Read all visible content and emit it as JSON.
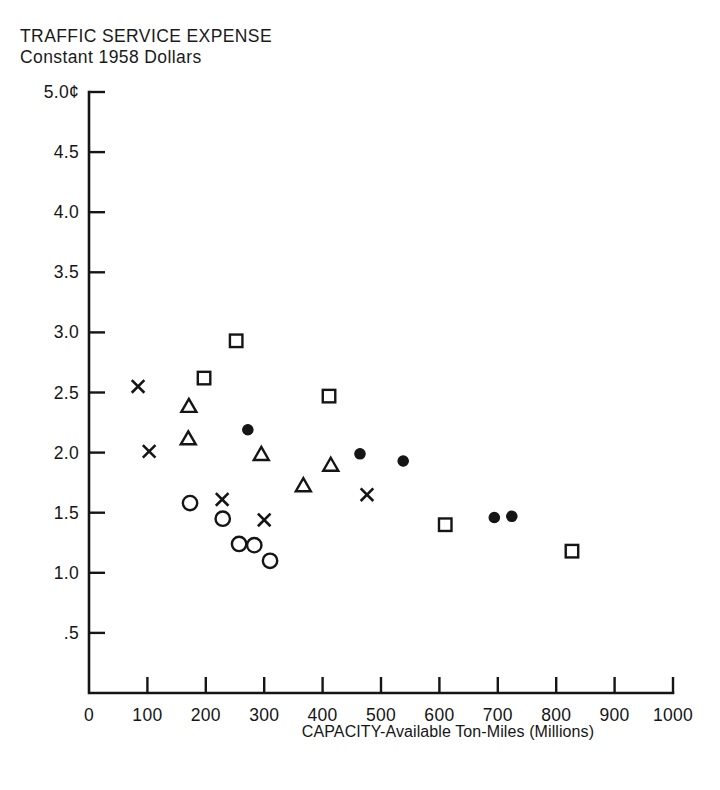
{
  "header": {
    "cropped_top_text": "",
    "title_line1": "TRAFFIC SERVICE EXPENSE",
    "title_line2": "Constant 1958 Dollars"
  },
  "axis": {
    "y_tick_labels": [
      "5.0¢",
      "4.5",
      "4.0",
      "3.5",
      "3.0",
      "2.5",
      "2.0",
      "1.5",
      "1.0",
      ".5"
    ],
    "x_tick_labels": [
      "0",
      "100",
      "200",
      "300",
      "400",
      "500",
      "600",
      "700",
      "800",
      "900",
      "1000"
    ],
    "x_title": "CAPACITY-Available Ton-Miles (Millions)"
  },
  "colors": {
    "ink": "#151515",
    "background": "#ffffff"
  },
  "chart_data": {
    "type": "scatter",
    "title": "TRAFFIC SERVICE EXPENSE",
    "subtitle": "Constant 1958 Dollars",
    "xlabel": "CAPACITY-Available Ton-Miles (Millions)",
    "ylabel": "TRAFFIC SERVICE EXPENSE (Constant 1958 Dollars, cents)",
    "xlim": [
      0,
      1000
    ],
    "ylim": [
      0,
      5.0
    ],
    "xticks": [
      0,
      100,
      200,
      300,
      400,
      500,
      600,
      700,
      800,
      900,
      1000
    ],
    "yticks": [
      0.5,
      1.0,
      1.5,
      2.0,
      2.5,
      3.0,
      3.5,
      4.0,
      4.5,
      5.0
    ],
    "grid": false,
    "legend": false,
    "series": [
      {
        "name": "cross",
        "marker": "x",
        "filled": false,
        "points": [
          {
            "x": 84,
            "y": 2.55
          },
          {
            "x": 103,
            "y": 2.01
          },
          {
            "x": 228,
            "y": 1.61
          },
          {
            "x": 300,
            "y": 1.44
          },
          {
            "x": 476,
            "y": 1.65
          }
        ]
      },
      {
        "name": "open-square",
        "marker": "square",
        "filled": false,
        "points": [
          {
            "x": 197,
            "y": 2.62
          },
          {
            "x": 252,
            "y": 2.93
          },
          {
            "x": 411,
            "y": 2.47
          },
          {
            "x": 610,
            "y": 1.4
          },
          {
            "x": 827,
            "y": 1.18
          }
        ]
      },
      {
        "name": "open-triangle",
        "marker": "triangle",
        "filled": false,
        "points": [
          {
            "x": 171,
            "y": 2.38
          },
          {
            "x": 170,
            "y": 2.11
          },
          {
            "x": 295,
            "y": 1.98
          },
          {
            "x": 367,
            "y": 1.72
          },
          {
            "x": 414,
            "y": 1.89
          }
        ]
      },
      {
        "name": "open-circle",
        "marker": "circle",
        "filled": false,
        "points": [
          {
            "x": 173,
            "y": 1.58
          },
          {
            "x": 229,
            "y": 1.45
          },
          {
            "x": 257,
            "y": 1.24
          },
          {
            "x": 283,
            "y": 1.23
          },
          {
            "x": 310,
            "y": 1.1
          }
        ]
      },
      {
        "name": "filled-circle",
        "marker": "circle",
        "filled": true,
        "points": [
          {
            "x": 272,
            "y": 2.19
          },
          {
            "x": 464,
            "y": 1.99
          },
          {
            "x": 538,
            "y": 1.93
          },
          {
            "x": 694,
            "y": 1.46
          },
          {
            "x": 724,
            "y": 1.47
          }
        ]
      }
    ]
  }
}
